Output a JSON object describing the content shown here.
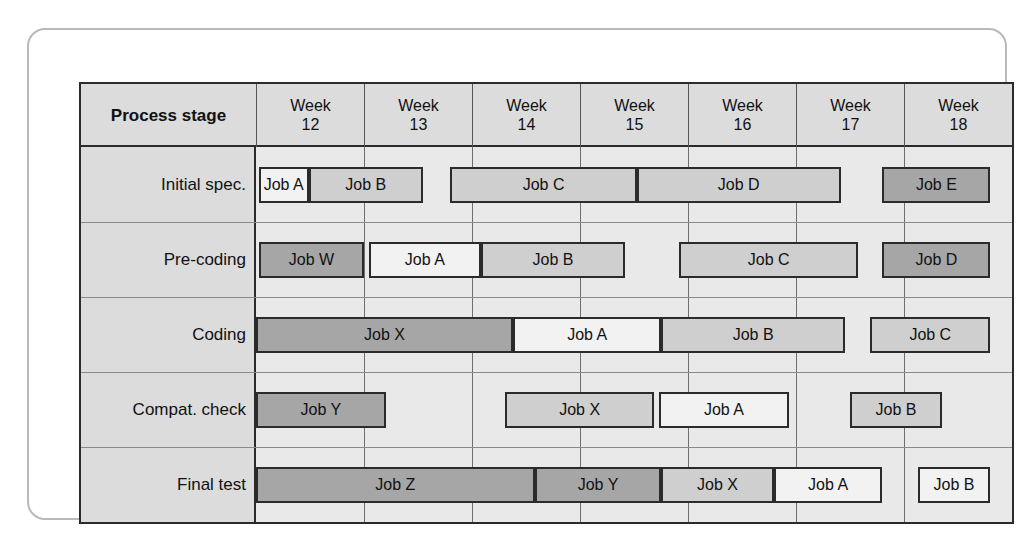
{
  "chart_data": {
    "type": "table",
    "xlabel": "",
    "ylabel": "",
    "grid": true,
    "legend": "none",
    "column_header_label": "Process stage",
    "categories": [
      "Week 12",
      "Week 13",
      "Week 14",
      "Week 15",
      "Week 16",
      "Week 17",
      "Week 18"
    ],
    "week_numbers": [
      "12",
      "13",
      "14",
      "15",
      "16",
      "17",
      "18"
    ],
    "week_word": "Week",
    "shades": {
      "white": "#f2f2f2",
      "mid": "#cfcfcf",
      "dark": "#a6a6a6",
      "panel": "#e9e9e9",
      "label_col": "#dcdcdc",
      "line": "#2b2b2b"
    },
    "rows": [
      {
        "stage": "Initial spec.",
        "bars": [
          {
            "label": "Job A",
            "start": 0.04,
            "end": 0.73,
            "shade": "white"
          },
          {
            "label": "Job B",
            "start": 0.73,
            "end": 2.32,
            "shade": "mid"
          },
          {
            "label": "Job C",
            "start": 2.7,
            "end": 5.29,
            "shade": "mid"
          },
          {
            "label": "Job D",
            "start": 5.29,
            "end": 8.12,
            "shade": "mid"
          },
          {
            "label": "Job E",
            "start": 8.7,
            "end": 10.2,
            "shade": "dark"
          }
        ]
      },
      {
        "stage": "Pre-coding",
        "bars": [
          {
            "label": "Job W",
            "start": 0.04,
            "end": 1.5,
            "shade": "dark"
          },
          {
            "label": "Job A",
            "start": 1.57,
            "end": 3.12,
            "shade": "white"
          },
          {
            "label": "Job B",
            "start": 3.12,
            "end": 5.13,
            "shade": "mid"
          },
          {
            "label": "Job C",
            "start": 5.88,
            "end": 8.36,
            "shade": "mid"
          },
          {
            "label": "Job D",
            "start": 8.7,
            "end": 10.2,
            "shade": "dark"
          }
        ]
      },
      {
        "stage": "Coding",
        "bars": [
          {
            "label": "Job X",
            "start": 0.0,
            "end": 3.57,
            "shade": "dark"
          },
          {
            "label": "Job A",
            "start": 3.57,
            "end": 5.63,
            "shade": "white"
          },
          {
            "label": "Job B",
            "start": 5.63,
            "end": 8.18,
            "shade": "mid"
          },
          {
            "label": "Job C",
            "start": 8.53,
            "end": 10.2,
            "shade": "mid"
          }
        ]
      },
      {
        "stage": "Compat. check",
        "bars": [
          {
            "label": "Job Y",
            "start": 0.0,
            "end": 1.8,
            "shade": "dark"
          },
          {
            "label": "Job X",
            "start": 3.46,
            "end": 5.53,
            "shade": "mid"
          },
          {
            "label": "Job A",
            "start": 5.6,
            "end": 7.4,
            "shade": "white"
          },
          {
            "label": "Job B",
            "start": 8.25,
            "end": 9.53,
            "shade": "mid"
          }
        ]
      },
      {
        "stage": "Final test",
        "bars": [
          {
            "label": "Job Z",
            "start": 0.0,
            "end": 3.87,
            "shade": "dark"
          },
          {
            "label": "Job Y",
            "start": 3.87,
            "end": 5.63,
            "shade": "dark"
          },
          {
            "label": "Job X",
            "start": 5.63,
            "end": 7.19,
            "shade": "mid"
          },
          {
            "label": "Job A",
            "start": 7.19,
            "end": 8.7,
            "shade": "white"
          },
          {
            "label": "Job B",
            "start": 9.19,
            "end": 10.2,
            "shade": "white"
          }
        ]
      }
    ]
  }
}
